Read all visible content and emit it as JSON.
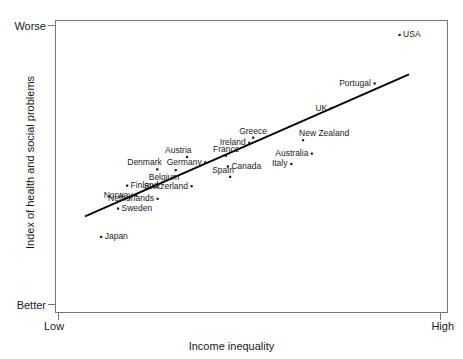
{
  "chart_data": {
    "type": "scatter",
    "title": "",
    "xlabel": "Income inequality",
    "ylabel": "Index of health and social problems",
    "x_tick_labels": [
      "Low",
      "High"
    ],
    "y_tick_labels": [
      "Worse",
      "Better"
    ],
    "y_axis_direction": "Worse at top, Better at bottom",
    "grid": false,
    "legend": "none",
    "xlim": [
      0,
      1
    ],
    "ylim": [
      0,
      1
    ],
    "trendline": {
      "present": true,
      "x0": 0.0,
      "y0": 0.27,
      "x1": 1.0,
      "y1": 0.82,
      "color": "#000000"
    },
    "points": [
      {
        "name": "Japan",
        "x": 0.05,
        "y": 0.19,
        "label_pos": "right"
      },
      {
        "name": "Norway",
        "x": 0.158,
        "y": 0.351,
        "label_pos": "left"
      },
      {
        "name": "Sweden",
        "x": 0.102,
        "y": 0.3,
        "label_pos": "right"
      },
      {
        "name": "Finland",
        "x": 0.13,
        "y": 0.389,
        "label_pos": "right"
      },
      {
        "name": "Netherlands",
        "x": 0.224,
        "y": 0.338,
        "label_pos": "left"
      },
      {
        "name": "Denmark",
        "x": 0.223,
        "y": 0.452,
        "label_pos": "above-left"
      },
      {
        "name": "Belgium",
        "x": 0.28,
        "y": 0.449,
        "label_pos": "below-left"
      },
      {
        "name": "Austria",
        "x": 0.315,
        "y": 0.5,
        "label_pos": "above-left"
      },
      {
        "name": "Germany",
        "x": 0.371,
        "y": 0.479,
        "label_pos": "left"
      },
      {
        "name": "Switzerland",
        "x": 0.329,
        "y": 0.387,
        "label_pos": "left"
      },
      {
        "name": "Spain",
        "x": 0.448,
        "y": 0.423,
        "label_pos": "above-left"
      },
      {
        "name": "Canada",
        "x": 0.441,
        "y": 0.463,
        "label_pos": "right"
      },
      {
        "name": "France",
        "x": 0.435,
        "y": 0.505,
        "label_pos": "above"
      },
      {
        "name": "Ireland",
        "x": 0.507,
        "y": 0.555,
        "label_pos": "left"
      },
      {
        "name": "Greece",
        "x": 0.519,
        "y": 0.575,
        "label_pos": "above"
      },
      {
        "name": "Italy",
        "x": 0.637,
        "y": 0.473,
        "label_pos": "left"
      },
      {
        "name": "Australia",
        "x": 0.7,
        "y": 0.513,
        "label_pos": "left"
      },
      {
        "name": "New Zealand",
        "x": 0.673,
        "y": 0.565,
        "label_pos": "above-right"
      },
      {
        "name": "UK",
        "x": 0.759,
        "y": 0.688,
        "label_pos": "left"
      },
      {
        "name": "Portugal",
        "x": 0.894,
        "y": 0.785,
        "label_pos": "left"
      },
      {
        "name": "USA",
        "x": 0.971,
        "y": 0.973,
        "label_pos": "right"
      }
    ]
  },
  "plot": {
    "frame_color": "#777777",
    "point_color": "#1a1a1a",
    "trendline_color": "#000000"
  }
}
